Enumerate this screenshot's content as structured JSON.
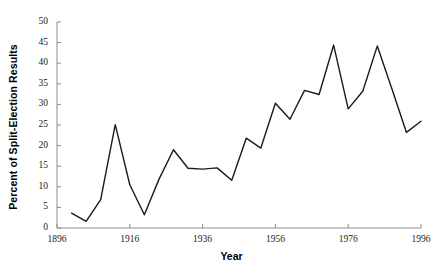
{
  "chart_data": {
    "type": "line",
    "title": "",
    "xlabel": "Year",
    "ylabel": "Percent of Split-Election Results",
    "xlim": [
      1896,
      1996
    ],
    "ylim": [
      0,
      50
    ],
    "grid": false,
    "legend": null,
    "xticks": [
      1896,
      1916,
      1936,
      1956,
      1976,
      1996
    ],
    "yticks": [
      0,
      5,
      10,
      15,
      20,
      25,
      30,
      35,
      40,
      45,
      50
    ],
    "line_color": "#1a1a1a",
    "axis_color": "#8c8c8c",
    "series": [
      {
        "name": "Percent of Split-Election Results",
        "x": [
          1900,
          1904,
          1908,
          1912,
          1916,
          1920,
          1924,
          1928,
          1932,
          1936,
          1940,
          1944,
          1948,
          1952,
          1956,
          1960,
          1964,
          1968,
          1972,
          1976,
          1980,
          1984,
          1988,
          1992,
          1996
        ],
        "values": [
          3.6,
          1.6,
          6.9,
          25.1,
          10.5,
          3.2,
          11.8,
          19.0,
          14.5,
          14.3,
          14.6,
          11.6,
          21.8,
          19.4,
          30.3,
          26.4,
          33.4,
          32.4,
          44.4,
          28.9,
          33.2,
          44.2,
          33.8,
          23.2,
          25.9
        ]
      }
    ]
  }
}
